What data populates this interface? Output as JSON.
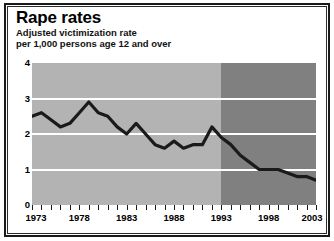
{
  "figure": {
    "title": "Rape rates",
    "subtitle_line1": "Adjusted victimization rate",
    "subtitle_line2": "per 1,000 persons age 12 and over"
  },
  "colors": {
    "band_early": "#b3b3b3",
    "band_late": "#808080",
    "gridline": "#ffffff",
    "series_line": "#1a1a1a",
    "frame": "#1a1a1a",
    "text": "#000000"
  },
  "chart_data": {
    "type": "line",
    "title": "Rape rates",
    "subtitle": "Adjusted victimization rate per 1,000 persons age 12 and over",
    "xlabel": "",
    "ylabel": "",
    "xlim": [
      1973,
      2003
    ],
    "ylim": [
      0,
      4
    ],
    "yticks": [
      0,
      1,
      2,
      3,
      4
    ],
    "ytick_labels": [
      "0",
      "1",
      "2",
      "3",
      "4"
    ],
    "xticks": [
      1973,
      1978,
      1983,
      1988,
      1993,
      1998,
      2003
    ],
    "xtick_labels": [
      "1973",
      "1978",
      "1983",
      "1988",
      "1993",
      "1998",
      "2003"
    ],
    "minor_xticks_every": 1,
    "grid": "horizontal-white",
    "legend": "none",
    "shaded_regions": [
      {
        "name": "pre-redesign",
        "x_from": 1973,
        "x_to": 1993,
        "color": "#b3b3b3"
      },
      {
        "name": "post-redesign",
        "x_from": 1993,
        "x_to": 2003,
        "color": "#808080"
      }
    ],
    "x": [
      1973,
      1974,
      1975,
      1976,
      1977,
      1978,
      1979,
      1980,
      1981,
      1982,
      1983,
      1984,
      1985,
      1986,
      1987,
      1988,
      1989,
      1990,
      1991,
      1992,
      1993,
      1994,
      1995,
      1996,
      1997,
      1998,
      1999,
      2000,
      2001,
      2002,
      2003
    ],
    "values": [
      2.5,
      2.6,
      2.4,
      2.2,
      2.3,
      2.6,
      2.9,
      2.6,
      2.5,
      2.2,
      2.0,
      2.3,
      2.0,
      1.7,
      1.6,
      1.8,
      1.6,
      1.7,
      1.7,
      2.2,
      1.9,
      1.7,
      1.4,
      1.2,
      1.0,
      1.0,
      1.0,
      0.9,
      0.8,
      0.8,
      0.7
    ],
    "series": [
      {
        "name": "Adjusted victimization rate per 1,000 persons age 12 and over",
        "color": "#1a1a1a",
        "values": [
          2.5,
          2.6,
          2.4,
          2.2,
          2.3,
          2.6,
          2.9,
          2.6,
          2.5,
          2.2,
          2.0,
          2.3,
          2.0,
          1.7,
          1.6,
          1.8,
          1.6,
          1.7,
          1.7,
          2.2,
          1.9,
          1.7,
          1.4,
          1.2,
          1.0,
          1.0,
          1.0,
          0.9,
          0.8,
          0.8,
          0.7
        ]
      }
    ]
  }
}
